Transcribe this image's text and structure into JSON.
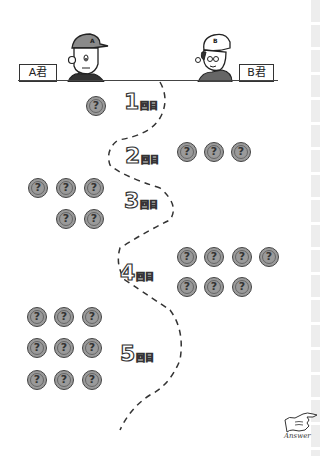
{
  "players": {
    "a": {
      "label": "A君",
      "cap_letter": "A"
    },
    "b": {
      "label": "B君",
      "cap_letter": "B"
    }
  },
  "rounds": [
    {
      "number": "1",
      "suffix": "回目",
      "side": "A",
      "coins": 1
    },
    {
      "number": "2",
      "suffix": "回目",
      "side": "B",
      "coins": 3
    },
    {
      "number": "3",
      "suffix": "回目",
      "side": "A",
      "coins": 5
    },
    {
      "number": "4",
      "suffix": "回目",
      "side": "B",
      "coins": 7
    },
    {
      "number": "5",
      "suffix": "回目",
      "side": "A",
      "coins": 9
    }
  ],
  "coin_symbol": "?",
  "answer_link": {
    "label": "Answer",
    "icon": "pointing-hand-icon"
  },
  "colors": {
    "coin_fill": "#9a9a9a",
    "line": "#333333",
    "strip": "#ededed"
  }
}
